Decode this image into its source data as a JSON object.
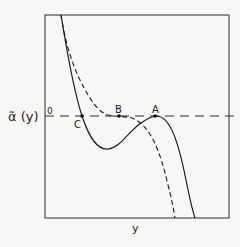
{
  "diagram": {
    "y_axis_label": "α̃ (y)",
    "x_axis_label": "y",
    "zero_label": "0",
    "points": [
      {
        "id": "A",
        "label": "A"
      },
      {
        "id": "B",
        "label": "B"
      },
      {
        "id": "C",
        "label": "C"
      }
    ],
    "curves": [
      {
        "name": "solid-curve",
        "style": "solid"
      },
      {
        "name": "dashed-curve",
        "style": "dashed"
      }
    ],
    "reference_line": {
      "style": "long-dash",
      "value": "0"
    },
    "colors": {
      "line": "#1a1a1a",
      "background": "#f7f7f5"
    }
  }
}
